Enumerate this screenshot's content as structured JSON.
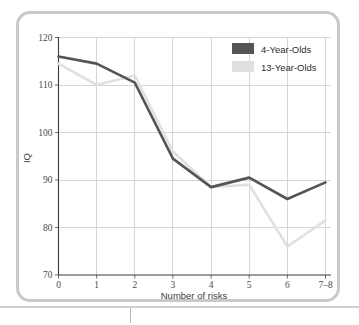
{
  "chart_data": {
    "type": "line",
    "title": "",
    "xlabel": "Number of risks",
    "ylabel": "IQ",
    "categories": [
      "0",
      "1",
      "2",
      "3",
      "4",
      "5",
      "6",
      "7–8"
    ],
    "xlim": [
      0,
      7
    ],
    "ylim": [
      70,
      120
    ],
    "ytick_labels": [
      "70",
      "80",
      "90",
      "100",
      "110",
      "120"
    ],
    "ytick_values": [
      70,
      80,
      90,
      100,
      110,
      120
    ],
    "grid": true,
    "legend_position": "top-right",
    "series": [
      {
        "name": "4-Year-Olds",
        "color": "#555555",
        "values": [
          116,
          114.5,
          110.5,
          94.5,
          88.5,
          90.5,
          86,
          89.5
        ]
      },
      {
        "name": "13-Year-Olds",
        "color": "#e0e0e0",
        "values": [
          114.5,
          110,
          112,
          96,
          88.5,
          89,
          76,
          81.5
        ]
      }
    ]
  },
  "legend": {
    "items": [
      {
        "label": "4-Year-Olds",
        "color": "#555555"
      },
      {
        "label": "13-Year-Olds",
        "color": "#e0e0e0"
      }
    ]
  },
  "axes": {
    "x_title": "Number of risks",
    "y_title": "IQ",
    "x_ticks": [
      "0",
      "1",
      "2",
      "3",
      "4",
      "5",
      "6",
      "7–8"
    ],
    "y_ticks": [
      "120",
      "110",
      "100",
      "90",
      "80",
      "70"
    ]
  }
}
